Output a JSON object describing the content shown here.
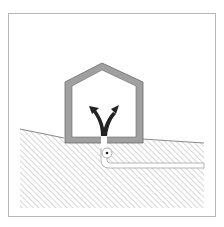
{
  "diagram": {
    "colors": {
      "frame": "#b8b8b8",
      "wall": "#a0a0a0",
      "wall_outline": "#6a6a6a",
      "hatch": "#b0b0b0",
      "ground_line": "#6a6a6a",
      "arrow": "#222222",
      "pipe_outline": "#9a9a9a"
    },
    "elements": {
      "house": "house-outline",
      "ground": "hatched-soil",
      "pipe": "service-pipe",
      "valve": "connection-point",
      "arrow": "branching-supply-arrow"
    }
  }
}
